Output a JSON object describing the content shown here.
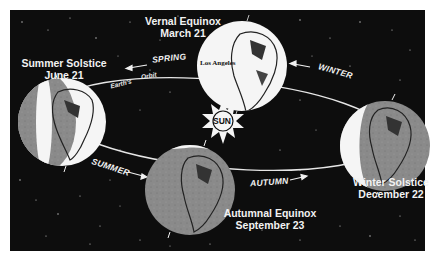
{
  "diagram": {
    "type": "seasons-orbit",
    "colors": {
      "space": "#0d0d0d",
      "lit": "#f5f5f5",
      "dark": "#8a8a8a",
      "text": "#f2f2f2",
      "orbit": "#e6e6e6"
    },
    "sun": {
      "label": "SUN",
      "icon": "sun-icon"
    },
    "orbit": {
      "label_part1": "Earth's",
      "label_part2": "Orbit"
    },
    "seasons": {
      "spring": "SPRING",
      "summer": "SUMMER",
      "autumn": "AUTUMN",
      "winter": "WINTER"
    },
    "positions": {
      "vernal": {
        "title": "Vernal Equinox",
        "date": "March 21",
        "city": "Los Angeles"
      },
      "summer": {
        "title": "Summer Solstice",
        "date": "June 21"
      },
      "autumnal": {
        "title": "Autumnal Equinox",
        "date": "September 23"
      },
      "winter": {
        "title": "Winter Solstice",
        "date": "December 22"
      }
    }
  }
}
